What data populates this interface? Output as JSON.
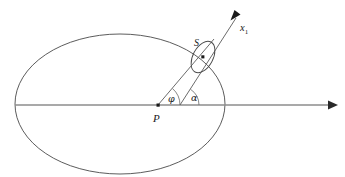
{
  "figure": {
    "background_color": "#ffffff",
    "width": 345,
    "height": 177
  },
  "labels": {
    "center_point": "P",
    "small_ellipse": "S",
    "axis_label": "x",
    "axis_label_subscript": "1",
    "angle_phi": "φ",
    "angle_alpha": "α"
  },
  "colors": {
    "curve": "#4a4a4a",
    "axis": "#8c8c8c",
    "ray": "#5a5a5a",
    "arc": "#6a6a6a",
    "text": "#1a1a1a"
  },
  "geometry": {
    "large_ellipse": {
      "cx": 120,
      "cy": 104,
      "rx": 105,
      "ry": 70,
      "rotation": 0
    },
    "small_ellipse": {
      "cx": 203,
      "cy": 57,
      "rx": 10,
      "ry": 17,
      "rotation": 28
    },
    "point_P": {
      "x": 158,
      "y": 105
    },
    "point_S": {
      "x": 203,
      "y": 57
    },
    "horizontal_axis": {
      "x1": 15,
      "y1": 105,
      "x2": 336,
      "y2": 105
    },
    "ray_x1": {
      "x1": 180,
      "y1": 105,
      "x2": 240,
      "y2": 12
    },
    "ray_PS": {
      "x1": 158,
      "y1": 105,
      "x2": 213,
      "y2": 40
    },
    "angle_phi_value_deg": 50,
    "angle_alpha_value_deg": 57
  }
}
